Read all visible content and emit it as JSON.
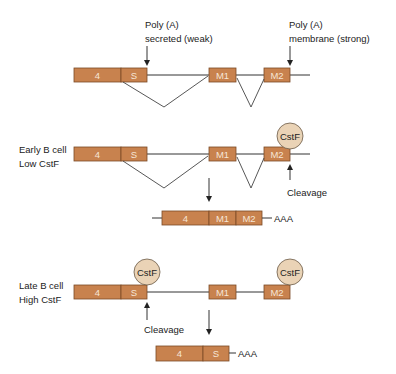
{
  "colors": {
    "exon_fill": "#c8824e",
    "exon_stroke": "#7a4a26",
    "cstf_fill": "#ead3b6",
    "line": "#333333"
  },
  "top": {
    "polyA_secreted": {
      "line1": "Poly (A)",
      "line2": "secreted (weak)"
    },
    "polyA_membrane": {
      "line1": "Poly (A)",
      "line2": "membrane (strong)"
    },
    "exons": [
      "4",
      "S",
      "M1",
      "M2"
    ]
  },
  "early": {
    "label_line1": "Early B cell",
    "label_line2": "Low CstF",
    "exons": [
      "4",
      "S",
      "M1",
      "M2"
    ],
    "cstf": "CstF",
    "cleavage": "Cleavage",
    "product": {
      "exons": [
        "4",
        "M1",
        "M2"
      ],
      "tail": "AAA"
    }
  },
  "late": {
    "label_line1": "Late B cell",
    "label_line2": "High CstF",
    "exons": [
      "4",
      "S",
      "M1",
      "M2"
    ],
    "cstf": "CstF",
    "cleavage": "Cleavage",
    "product": {
      "exons": [
        "4",
        "S"
      ],
      "tail": "AAA"
    }
  }
}
